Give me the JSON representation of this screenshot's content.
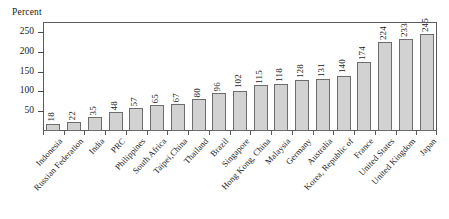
{
  "chart_data": {
    "type": "bar",
    "title": "",
    "subtitle": "",
    "xlabel": "",
    "ylabel": "Percent",
    "ylim": [
      0,
      275
    ],
    "yticks": [
      50,
      100,
      150,
      200,
      250
    ],
    "grid": false,
    "legend": "none",
    "value_labels": true,
    "value_label_orientation": "vertical",
    "category_label_rotation": -47,
    "categories": [
      "Indonesia",
      "Russian Federation",
      "India",
      "PRC",
      "Philippines",
      "South Africa",
      "Taipei,China",
      "Thailand",
      "Brazil",
      "Singapore",
      "Hong Kong, China",
      "Malaysia",
      "Germany",
      "Australia",
      "Korea, Republic of",
      "France",
      "United States",
      "United Kingdom",
      "Japan"
    ],
    "values": [
      18,
      22,
      35,
      48,
      57,
      65,
      67,
      80,
      96,
      102,
      115,
      118,
      128,
      131,
      140,
      174,
      224,
      233,
      245
    ],
    "series": [
      {
        "name": "Percent",
        "values": [
          18,
          22,
          35,
          48,
          57,
          65,
          67,
          80,
          96,
          102,
          115,
          118,
          128,
          131,
          140,
          174,
          224,
          233,
          245
        ]
      }
    ],
    "colors": {
      "bar_fill": "#d2d2d2",
      "bar_stroke": "#6d6d6d",
      "axis": "#5c5c5c",
      "text": "#1a1a1a",
      "background": "#ffffff"
    }
  },
  "axis": {
    "unit_caption": "Percent"
  }
}
